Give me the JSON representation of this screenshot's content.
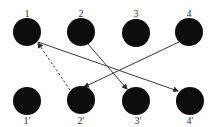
{
  "diagram": {
    "type": "bipartite-mapping",
    "colors": {
      "node": "#0d0d0d",
      "edge": "#3a3a3a",
      "label": "#333333",
      "background": "#ffffff"
    },
    "top_nodes": [
      {
        "id": "1",
        "label": "1",
        "cx": 27,
        "cy": 32
      },
      {
        "id": "2",
        "label": "2",
        "cx": 81,
        "cy": 32
      },
      {
        "id": "3",
        "label": "3",
        "cx": 136,
        "cy": 33
      },
      {
        "id": "4",
        "label": "4",
        "cx": 189,
        "cy": 32
      }
    ],
    "bottom_nodes": [
      {
        "id": "1p",
        "label": "1'",
        "cx": 27,
        "cy": 101
      },
      {
        "id": "2p",
        "label": "2'",
        "cx": 81,
        "cy": 100
      },
      {
        "id": "3p",
        "label": "3'",
        "cx": 136,
        "cy": 101
      },
      {
        "id": "4p",
        "label": "4'",
        "cx": 190,
        "cy": 101
      }
    ],
    "node_radius": 14,
    "edges": [
      {
        "from": "1",
        "to": "4'",
        "style": "solid",
        "arrow": "end"
      },
      {
        "from": "2",
        "to": "3'",
        "style": "solid",
        "arrow": "end"
      },
      {
        "from": "4",
        "to": "2'",
        "style": "solid",
        "arrow": "end"
      },
      {
        "from": "2'",
        "to": "1",
        "style": "dashed",
        "arrow": "end"
      }
    ]
  }
}
